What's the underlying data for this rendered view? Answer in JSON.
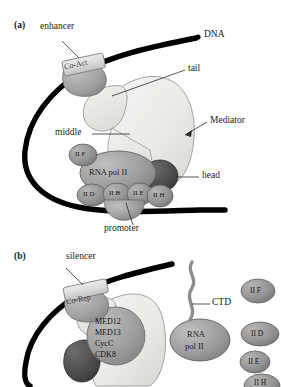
{
  "figure": {
    "type": "biology-diagram"
  },
  "panel_a": {
    "id": "(a)",
    "labels": {
      "enhancer": "enhancer",
      "dna": "DNA",
      "tail": "tail",
      "mediator": "Mediator",
      "middle": "middle",
      "head": "head",
      "promoter": "promoter"
    },
    "coactivator": "Co-Act",
    "polymerase": "RNA pol II",
    "factors": [
      {
        "label": "II F"
      },
      {
        "label": "II D"
      },
      {
        "label": "II B"
      },
      {
        "label": "II E"
      },
      {
        "label": "II H"
      }
    ]
  },
  "panel_b": {
    "id": "(b)",
    "labels": {
      "silencer": "silencer",
      "ctd": "CTD"
    },
    "corepressor": "Co-Rep",
    "cdk8_module": [
      "MED12",
      "MED13",
      "CycC",
      "CDK8"
    ],
    "polymerase_line1": "RNA",
    "polymerase_line2": "pol II",
    "free_factors": [
      {
        "label": "II F"
      },
      {
        "label": "II D"
      },
      {
        "label": "II E"
      },
      {
        "label": "II H"
      }
    ]
  },
  "colors": {
    "dna": "#000000",
    "mediator_body": "#eceeea",
    "mediator_tail": "#e2e5df",
    "head_lobe": "#4c4c4c",
    "polymerase": "#9a9a9a",
    "factor": "#8f8f8f",
    "cofactor_box": "#d8d8d8",
    "cofactor_blob": "#a3a3a3",
    "cdk8": "#9d9d9d",
    "leader": "#2b2b2b"
  }
}
